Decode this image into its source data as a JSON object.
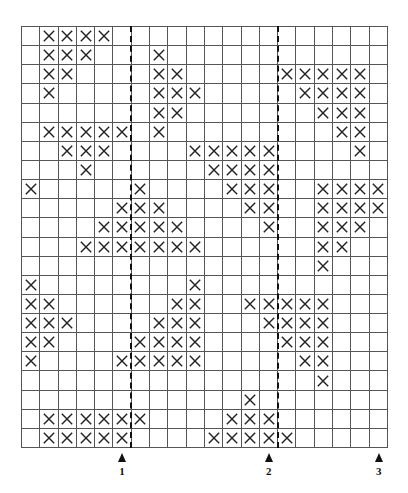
{
  "grid": {
    "columns": 20,
    "rows": 22,
    "line_color": "#555555",
    "mark_color": "#222222",
    "mark_symbol": "X",
    "marked_cells_by_row": [
      [
        2,
        3,
        4,
        5
      ],
      [
        2,
        3,
        4,
        8
      ],
      [
        2,
        3,
        8,
        9,
        15,
        16,
        17,
        18,
        19
      ],
      [
        2,
        8,
        9,
        10,
        16,
        17,
        18,
        19
      ],
      [
        8,
        9,
        17,
        18,
        19
      ],
      [
        2,
        3,
        4,
        5,
        6,
        8,
        18,
        19
      ],
      [
        3,
        4,
        5,
        10,
        11,
        12,
        13,
        14,
        19
      ],
      [
        4,
        11,
        12,
        13,
        14
      ],
      [
        1,
        7,
        12,
        13,
        14,
        17,
        18,
        19,
        20
      ],
      [
        6,
        7,
        8,
        13,
        14,
        17,
        18,
        19,
        20
      ],
      [
        5,
        6,
        7,
        8,
        9,
        14,
        17,
        18,
        19
      ],
      [
        4,
        5,
        6,
        7,
        8,
        9,
        10,
        17,
        18
      ],
      [
        17
      ],
      [
        1,
        10
      ],
      [
        1,
        2,
        9,
        10,
        13,
        14,
        15,
        16,
        17
      ],
      [
        1,
        2,
        3,
        8,
        9,
        10,
        14,
        15,
        16,
        17
      ],
      [
        1,
        2,
        7,
        8,
        9,
        10,
        15,
        16,
        17
      ],
      [
        1,
        6,
        7,
        8,
        9,
        10,
        16,
        17
      ],
      [
        17
      ],
      [
        13
      ],
      [
        2,
        3,
        4,
        5,
        6,
        7,
        12,
        13,
        14
      ],
      [
        2,
        3,
        4,
        5,
        6,
        11,
        12,
        13,
        14,
        15
      ]
    ]
  },
  "dashed_lines": [
    {
      "after_column": 6
    },
    {
      "after_column": 14
    }
  ],
  "markers": [
    {
      "label": "1",
      "column": 6
    },
    {
      "label": "2",
      "column": 14
    },
    {
      "label": "3",
      "column": 20
    }
  ]
}
